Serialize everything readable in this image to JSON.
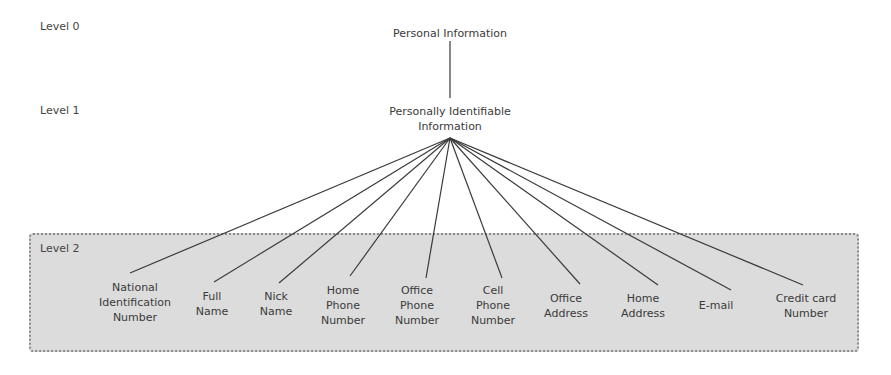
{
  "levels": [
    {
      "label": "Level 0"
    },
    {
      "label": "Level 1"
    },
    {
      "label": "Level 2"
    }
  ],
  "root": {
    "label": "Personal Information"
  },
  "pii": {
    "label_lines": [
      "Personally Identifiable",
      "Information"
    ]
  },
  "leaves": [
    {
      "lines": [
        "National",
        "Identification",
        "Number"
      ]
    },
    {
      "lines": [
        "Full",
        "Name"
      ]
    },
    {
      "lines": [
        "Nick",
        "Name"
      ]
    },
    {
      "lines": [
        "Home",
        "Phone",
        "Number"
      ]
    },
    {
      "lines": [
        "Office",
        "Phone",
        "Number"
      ]
    },
    {
      "lines": [
        "Cell",
        "Phone",
        "Number"
      ]
    },
    {
      "lines": [
        "Office",
        "Address"
      ]
    },
    {
      "lines": [
        "Home",
        "Address"
      ]
    },
    {
      "lines": [
        "E-mail"
      ]
    },
    {
      "lines": [
        "Credit card",
        "Number"
      ]
    }
  ],
  "colors": {
    "level2_fill": "#dcdcdc",
    "edge": "#3a3a3a"
  }
}
